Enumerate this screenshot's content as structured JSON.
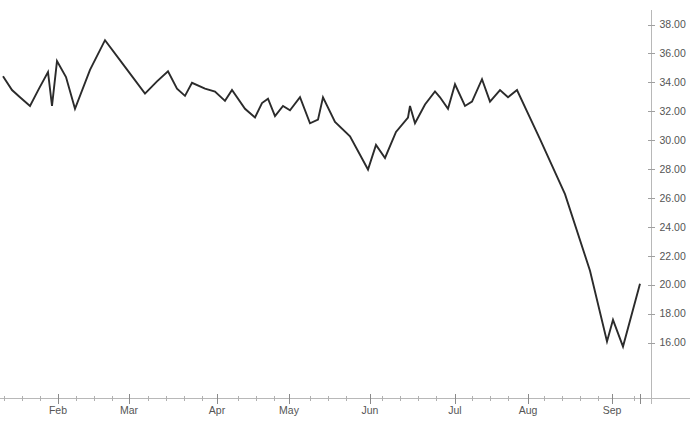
{
  "chart_data": {
    "type": "line",
    "title": "",
    "subtitle": "",
    "xlabel": "",
    "ylabel": "",
    "grid": false,
    "legend": false,
    "legend_position": "none",
    "line_color": "#2b2b2b",
    "axis_color": "#b8b8b8",
    "tick_label_color": "#555555",
    "y_axis_position": "right",
    "ylim": [
      14.6,
      38.9
    ],
    "y_ticks": [
      16.0,
      18.0,
      20.0,
      22.0,
      24.0,
      26.0,
      28.0,
      30.0,
      32.0,
      34.0,
      36.0,
      38.0
    ],
    "y_tick_labels": [
      "16.00",
      "18.00",
      "20.00",
      "22.00",
      "24.00",
      "26.00",
      "28.00",
      "30.00",
      "32.00",
      "34.00",
      "36.00",
      "38.00"
    ],
    "x_tick_labels": [
      "Feb",
      "Mar",
      "Apr",
      "May",
      "Jun",
      "Jul",
      "Aug",
      "Sep"
    ],
    "x_tick_positions": [
      58,
      129,
      217,
      289,
      370,
      455,
      528,
      612
    ],
    "x_range_px": [
      3,
      640
    ],
    "series": [
      {
        "name": "price",
        "x": [
          3,
          12,
          20,
          30,
          39,
          48,
          52,
          57,
          66,
          75,
          90,
          105,
          125,
          145,
          157,
          168,
          177,
          185,
          192,
          205,
          215,
          225,
          232,
          245,
          255,
          262,
          268,
          275,
          283,
          290,
          300,
          310,
          318,
          323,
          335,
          350,
          368,
          376,
          385,
          396,
          408,
          410,
          415,
          425,
          435,
          440,
          448,
          455,
          465,
          472,
          482,
          490,
          500,
          508,
          517,
          540,
          565,
          590,
          607,
          613,
          623,
          640
        ],
        "values": [
          34.45,
          33.5,
          33.0,
          32.4,
          33.6,
          34.75,
          32.4,
          35.5,
          34.4,
          32.2,
          34.9,
          36.95,
          35.1,
          33.25,
          34.1,
          34.8,
          33.6,
          33.1,
          34.0,
          33.6,
          33.4,
          32.75,
          33.5,
          32.2,
          31.6,
          32.6,
          32.9,
          31.7,
          32.4,
          32.1,
          33.0,
          31.2,
          31.45,
          33.0,
          31.3,
          30.3,
          28.0,
          29.7,
          28.8,
          30.6,
          31.6,
          32.4,
          31.2,
          32.5,
          33.4,
          33.0,
          32.2,
          33.9,
          32.4,
          32.7,
          34.25,
          32.7,
          33.5,
          33.0,
          33.5,
          30.1,
          26.3,
          21.0,
          16.1,
          17.6,
          15.75,
          20.1
        ]
      }
    ]
  },
  "axis": {
    "y_tick_count": 12,
    "x_minor_tick_interval_px": 18
  }
}
